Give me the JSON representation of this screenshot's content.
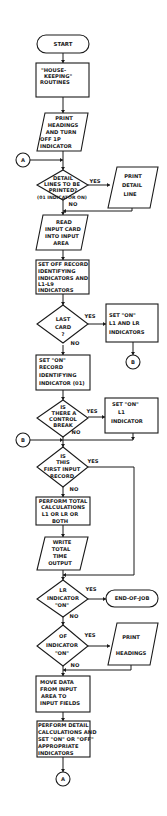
{
  "diagram": {
    "type": "program flowchart",
    "colors": {
      "ink": "#1a1a1a",
      "background": "#ffffff"
    },
    "nodes": {
      "start": {
        "shape": "terminal",
        "lines": [
          "START"
        ]
      },
      "housekeeping": {
        "shape": "process",
        "lines": [
          "\"HOUSE-",
          "KEEPING\"",
          "ROUTINES"
        ]
      },
      "print_headings_1": {
        "shape": "io",
        "lines": [
          "PRINT",
          "HEADINGS",
          "AND TURN",
          "OFF 1P",
          "INDICATOR"
        ]
      },
      "connector_a_in": {
        "shape": "connector",
        "label": "A"
      },
      "detail_lines_decision": {
        "shape": "decision",
        "lines": [
          "DETAIL",
          "LINES TO BE",
          "PRINTED?"
        ],
        "note": "(01 INDICATOR ON)"
      },
      "print_detail_line": {
        "shape": "io",
        "lines": [
          "PRINT",
          "DETAIL",
          "LINE"
        ]
      },
      "read_input_card": {
        "shape": "io",
        "lines": [
          "READ",
          "INPUT CARD",
          "INTO INPUT",
          "AREA"
        ]
      },
      "set_off_record": {
        "shape": "process",
        "lines": [
          "SET OFF RECORD",
          "IDENTIFYING",
          "INDICATORS AND",
          "L1-L9",
          "INDICATORS"
        ]
      },
      "last_card_decision": {
        "shape": "decision",
        "lines": [
          "LAST",
          "CARD",
          "?"
        ]
      },
      "set_on_l1_lr": {
        "shape": "process",
        "lines": [
          "SET \"ON\"",
          "L1 AND LR",
          "INDICATORS"
        ]
      },
      "connector_b_out": {
        "shape": "connector",
        "label": "B"
      },
      "set_on_record": {
        "shape": "process",
        "lines": [
          "SET \"ON\"",
          "RECORD",
          "IDENTIFYING",
          "INDICATOR (01)"
        ]
      },
      "control_break_decision": {
        "shape": "decision",
        "lines": [
          "IS",
          "THERE A",
          "CONTROL",
          "BREAK"
        ]
      },
      "set_on_l1": {
        "shape": "process",
        "lines": [
          "SET \"ON\"",
          "L1",
          "INDICATOR"
        ]
      },
      "connector_b_in": {
        "shape": "connector",
        "label": "B"
      },
      "first_input_decision": {
        "shape": "decision",
        "lines": [
          "IS",
          "THIS",
          "FIRST INPUT",
          "RECORD"
        ]
      },
      "perform_total": {
        "shape": "process",
        "lines": [
          "PERFORM TOTAL",
          "CALCULATIONS",
          "L1 OR LR OR",
          "BOTH"
        ]
      },
      "write_total": {
        "shape": "io",
        "lines": [
          "WRITE",
          "TOTAL",
          "TIME",
          "OUTPUT"
        ]
      },
      "lr_indicator_decision": {
        "shape": "decision",
        "lines": [
          "LR",
          "INDICATOR",
          "\"ON\""
        ]
      },
      "end_of_job": {
        "shape": "terminal",
        "lines": [
          "END-OF-JOB"
        ]
      },
      "of_indicator_decision": {
        "shape": "decision",
        "lines": [
          "OF",
          "INDICATOR",
          "\"ON\""
        ]
      },
      "print_headings_2": {
        "shape": "io",
        "lines": [
          "PRINT",
          "HEADINGS"
        ]
      },
      "move_data": {
        "shape": "process",
        "lines": [
          "MOVE DATA",
          "FROM INPUT",
          "AREA TO",
          "INPUT FIELDS"
        ]
      },
      "perform_detail": {
        "shape": "process",
        "lines": [
          "PERFORM DETAIL",
          "CALCULATIONS AND",
          "SET \"ON\" OR \"OFF\"",
          "APPROPRIATE",
          "INDICATORS"
        ]
      },
      "connector_a_out": {
        "shape": "connector",
        "label": "A"
      }
    },
    "edge_labels": {
      "yes": "YES",
      "no": "NO"
    }
  }
}
